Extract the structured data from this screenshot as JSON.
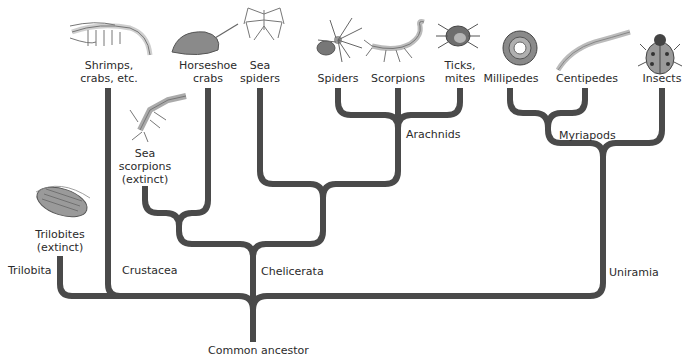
{
  "diagram": {
    "type": "phylogenetic-tree",
    "root_label": "Common ancestor",
    "line_color": "#4a4a4a",
    "groups": {
      "trilobita": "Trilobita",
      "crustacea": "Crustacea",
      "chelicerata": "Chelicerata",
      "arachnids": "Arachnids",
      "myriapods": "Myriapods",
      "uniramia": "Uniramia"
    },
    "taxa": {
      "trilobites": [
        "Trilobites",
        "(extinct)"
      ],
      "shrimps": [
        "Shrimps,",
        "crabs, etc."
      ],
      "horseshoe": [
        "Horseshoe",
        "crabs"
      ],
      "sea_scorpions": [
        "Sea",
        "scorpions",
        "(extinct)"
      ],
      "sea_spiders": [
        "Sea",
        "spiders"
      ],
      "spiders": [
        "Spiders"
      ],
      "scorpions": [
        "Scorpions"
      ],
      "ticks": [
        "Ticks,",
        "mites"
      ],
      "millipedes": [
        "Millipedes"
      ],
      "centipedes": [
        "Centipedes"
      ],
      "insects": [
        "Insects"
      ]
    },
    "icons": [
      "trilobite-icon",
      "shrimp-icon",
      "horseshoe-crab-icon",
      "sea-scorpion-icon",
      "sea-spider-icon",
      "spider-icon",
      "scorpion-icon",
      "tick-icon",
      "millipede-icon",
      "centipede-icon",
      "ladybug-icon"
    ]
  }
}
